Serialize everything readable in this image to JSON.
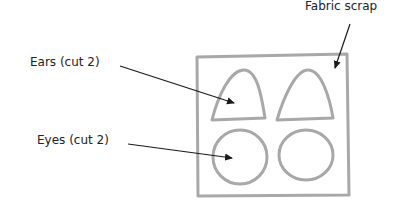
{
  "labels": {
    "fabric": "Fabric scrap",
    "ears": "Ears (cut 2)",
    "eyes": "Eyes (cut 2)"
  },
  "colors": {
    "outline": "#a8a8a8",
    "arrow": "#1a1a1a",
    "text": "#222222"
  }
}
